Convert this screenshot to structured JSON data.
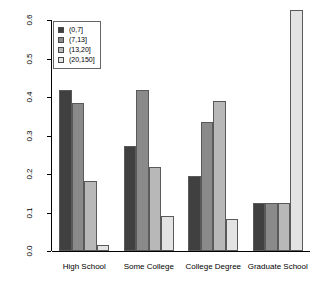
{
  "chart_data": {
    "type": "bar",
    "title": "",
    "xlabel": "",
    "ylabel": "PROPORTION",
    "ylim": [
      0.0,
      0.6
    ],
    "grid": false,
    "legend_position": "top-left",
    "categories": [
      "High School",
      "Some College",
      "College Degree",
      "Graduate School"
    ],
    "ytick_labels": [
      "0.0",
      "0.1",
      "0.2",
      "0.3",
      "0.4",
      "0.5",
      "0.6"
    ],
    "ytick_values": [
      0.0,
      0.1,
      0.2,
      0.3,
      0.4,
      0.5,
      0.6
    ],
    "series": [
      {
        "name": "(0,7]",
        "color": "#404040",
        "values": [
          0.418,
          0.274,
          0.195,
          0.125
        ]
      },
      {
        "name": "(7,13]",
        "color": "#8a8a8a",
        "values": [
          0.384,
          0.418,
          0.335,
          0.125
        ]
      },
      {
        "name": "(13,20]",
        "color": "#b8b8b8",
        "values": [
          0.182,
          0.218,
          0.39,
          0.125
        ]
      },
      {
        "name": "(20,150]",
        "color": "#e3e3e3",
        "values": [
          0.016,
          0.091,
          0.083,
          0.625
        ]
      }
    ]
  }
}
